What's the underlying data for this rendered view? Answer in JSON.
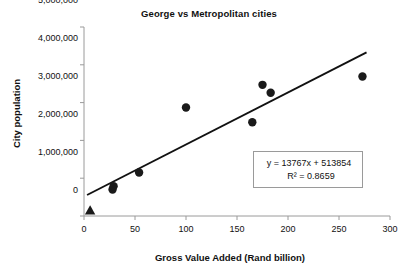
{
  "chart_data": {
    "type": "scatter",
    "title": "George vs Metropolitan cities",
    "xlabel": "Gross Value Added (Rand billion)",
    "ylabel": "City population",
    "xlim": [
      0,
      300
    ],
    "ylim": [
      0,
      5000000
    ],
    "xticks": [
      0,
      50,
      100,
      150,
      200,
      250,
      300
    ],
    "xtick_labels": [
      "0",
      "50",
      "100",
      "150",
      "200",
      "250",
      "300"
    ],
    "yticks": [
      0,
      1000000,
      2000000,
      3000000,
      4000000,
      5000000
    ],
    "ytick_labels": [
      "0",
      "1,000,000",
      "2,000,000",
      "3,000,000",
      "4,000,000",
      "5,000,000"
    ],
    "grid": false,
    "legend": "none",
    "series": [
      {
        "name": "Metropolitan cities",
        "marker": "circle",
        "color": "#1a1a1a",
        "points": [
          {
            "x": 28,
            "y": 700000
          },
          {
            "x": 29,
            "y": 790000
          },
          {
            "x": 54,
            "y": 1150000
          },
          {
            "x": 100,
            "y": 2870000
          },
          {
            "x": 165,
            "y": 2480000
          },
          {
            "x": 175,
            "y": 3470000
          },
          {
            "x": 183,
            "y": 3260000
          },
          {
            "x": 273,
            "y": 3690000
          }
        ]
      },
      {
        "name": "George",
        "marker": "triangle",
        "color": "#1a1a1a",
        "points": [
          {
            "x": 6,
            "y": 150000
          }
        ]
      }
    ],
    "trendline": {
      "slope": 13767,
      "intercept": 513854,
      "r_squared": 0.8659,
      "x_start": 3,
      "x_end": 277,
      "color": "#111111"
    },
    "annotations": {
      "equation": "y = 13767x + 513854",
      "r_squared_label": "R² = 0.8659"
    },
    "axis_color": "#9a9a9a"
  }
}
